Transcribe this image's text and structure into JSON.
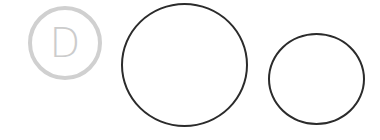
{
  "logo": {
    "letter": "D",
    "icon": "d-letter-circle-icon",
    "color": "#d0d0d0"
  },
  "shapes": [
    {
      "name": "large-circle",
      "stroke": "#2b2b2b"
    },
    {
      "name": "small-circle",
      "stroke": "#2b2b2b"
    }
  ]
}
